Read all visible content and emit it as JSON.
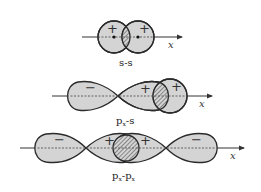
{
  "figure": {
    "panels": [
      {
        "id": "s-s",
        "label_main": "s-s",
        "label_sub": "",
        "label_tail": "",
        "axis_label": "x",
        "signs": [
          "+",
          "+"
        ]
      },
      {
        "id": "px-s",
        "label_main": "p",
        "label_sub": "x",
        "label_tail": "-s",
        "axis_label": "x",
        "signs": [
          "−",
          "+",
          "+"
        ]
      },
      {
        "id": "px-px",
        "label_main": "p",
        "label_sub": "x",
        "label_tail": "-p",
        "label_sub2": "x",
        "axis_label": "x",
        "signs": [
          "−",
          "+",
          "+",
          "−"
        ]
      }
    ],
    "colors": {
      "fill": "#d4d4d4",
      "stroke": "#2a2a2a",
      "hatch": "#444444",
      "background": "#ffffff"
    }
  }
}
